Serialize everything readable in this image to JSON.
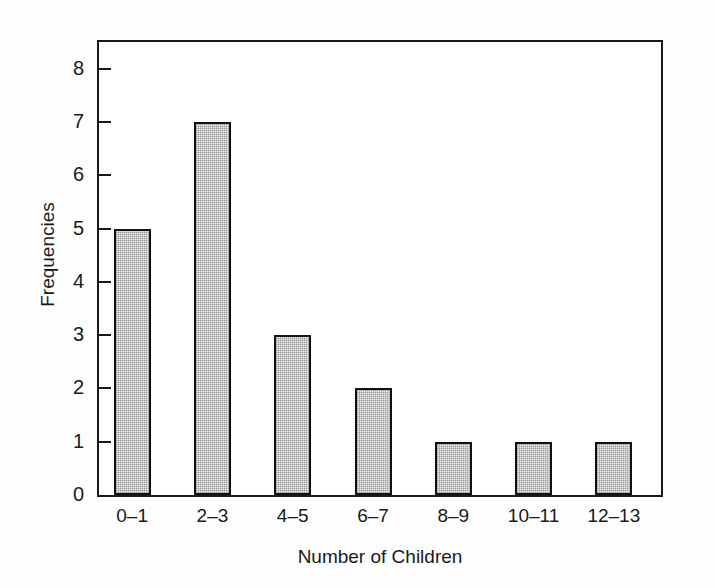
{
  "chart_data": {
    "type": "bar",
    "title": "",
    "subtitle": "",
    "xlabel": "Number of Children",
    "ylabel": "Frequencies",
    "categories": [
      "0–1",
      "2–3",
      "4–5",
      "6–7",
      "8–9",
      "10–11",
      "12–13"
    ],
    "values": [
      5,
      7,
      3,
      2,
      1,
      1,
      1
    ],
    "ylim": [
      0,
      8.5
    ],
    "yticks": [
      0,
      1,
      2,
      3,
      4,
      5,
      6,
      7,
      8
    ],
    "ytick_labels": [
      "0",
      "1",
      "2",
      "3",
      "4",
      "5",
      "6",
      "7",
      "8"
    ],
    "grid": false,
    "legend": null,
    "annotations": [],
    "style": {
      "bar_fill": "#efefef",
      "bar_edge": "#131313",
      "frame_color": "#1a1a1a",
      "background": "#ffffff",
      "tick_direction": "in"
    }
  },
  "axes": {
    "y": {
      "label": "Frequencies",
      "ticks": [
        {
          "value": 8,
          "label": "8"
        },
        {
          "value": 7,
          "label": "7"
        },
        {
          "value": 6,
          "label": "6"
        },
        {
          "value": 5,
          "label": "5"
        },
        {
          "value": 4,
          "label": "4"
        },
        {
          "value": 3,
          "label": "3"
        },
        {
          "value": 2,
          "label": "2"
        },
        {
          "value": 1,
          "label": "1"
        },
        {
          "value": 0,
          "label": "0"
        }
      ]
    },
    "x": {
      "label": "Number of Children",
      "ticks": [
        {
          "label": "0–1"
        },
        {
          "label": "2–3"
        },
        {
          "label": "4–5"
        },
        {
          "label": "6–7"
        },
        {
          "label": "8–9"
        },
        {
          "label": "10–11"
        },
        {
          "label": "12–13"
        }
      ]
    }
  },
  "bars": [
    {
      "category": "0–1",
      "value": 5
    },
    {
      "category": "2–3",
      "value": 7
    },
    {
      "category": "4–5",
      "value": 3
    },
    {
      "category": "6–7",
      "value": 2
    },
    {
      "category": "8–9",
      "value": 1
    },
    {
      "category": "10–11",
      "value": 1
    },
    {
      "category": "12–13",
      "value": 1
    }
  ]
}
